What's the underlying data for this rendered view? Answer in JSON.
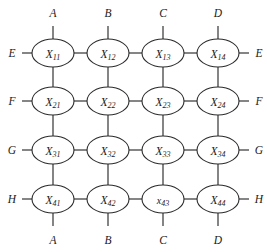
{
  "figure": {
    "type": "grid-network-diagram",
    "background_color": "#ffffff",
    "line_color": "#2b2b2b",
    "node_fill": "#ffffff",
    "rows": 4,
    "columns": 4
  },
  "geometry": {
    "column_centers": [
      53,
      108,
      163,
      218
    ],
    "row_centers": [
      53,
      101,
      150,
      199
    ],
    "node_radius_x": 21,
    "node_radius_y": 14,
    "top_stub_y": 26,
    "bottom_stub_y": 226,
    "left_stub_x": 22,
    "right_stub_x": 249,
    "top_label_y": 13,
    "bottom_label_y": 240,
    "left_label_x": 12,
    "right_label_x": 259
  },
  "nodes": [
    [
      {
        "base": "X",
        "sub": "11",
        "name": "node-x11",
        "lowercase": false
      },
      {
        "base": "X",
        "sub": "12",
        "name": "node-x12",
        "lowercase": false
      },
      {
        "base": "X",
        "sub": "13",
        "name": "node-x13",
        "lowercase": false
      },
      {
        "base": "X",
        "sub": "14",
        "name": "node-x14",
        "lowercase": false
      }
    ],
    [
      {
        "base": "X",
        "sub": "21",
        "name": "node-x21",
        "lowercase": false
      },
      {
        "base": "X",
        "sub": "22",
        "name": "node-x22",
        "lowercase": false
      },
      {
        "base": "X",
        "sub": "23",
        "name": "node-x23",
        "lowercase": false
      },
      {
        "base": "X",
        "sub": "24",
        "name": "node-x24",
        "lowercase": false
      }
    ],
    [
      {
        "base": "X",
        "sub": "31",
        "name": "node-x31",
        "lowercase": false
      },
      {
        "base": "X",
        "sub": "32",
        "name": "node-x32",
        "lowercase": false
      },
      {
        "base": "X",
        "sub": "33",
        "name": "node-x33",
        "lowercase": false
      },
      {
        "base": "X",
        "sub": "34",
        "name": "node-x34",
        "lowercase": false
      }
    ],
    [
      {
        "base": "X",
        "sub": "41",
        "name": "node-x41",
        "lowercase": false
      },
      {
        "base": "X",
        "sub": "42",
        "name": "node-x42",
        "lowercase": false
      },
      {
        "base": "x",
        "sub": "43",
        "name": "node-x43",
        "lowercase": true
      },
      {
        "base": "X",
        "sub": "44",
        "name": "node-x44",
        "lowercase": false
      }
    ]
  ],
  "port_labels": {
    "top": [
      "A",
      "B",
      "C",
      "D"
    ],
    "bottom": [
      "A",
      "B",
      "C",
      "D"
    ],
    "left": [
      "E",
      "F",
      "G",
      "H"
    ],
    "right": [
      "E",
      "F",
      "G",
      "H"
    ]
  }
}
